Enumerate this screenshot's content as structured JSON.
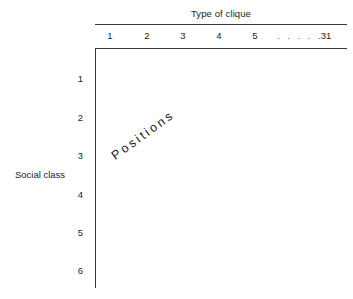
{
  "figure": {
    "columns": {
      "group_title": "Type of clique",
      "labels": [
        "1",
        "2",
        "3",
        "4",
        "5"
      ],
      "ellipsis": ". . . . .",
      "last_label": "31"
    },
    "rows": {
      "group_title": "Social class",
      "labels": [
        "1",
        "2",
        "3",
        "4",
        "5",
        "6"
      ]
    },
    "body": {
      "label": "Positions"
    }
  },
  "style": {
    "ink": "#1d1d1d",
    "rule": "#3a3a3a",
    "background": "#ffffff"
  }
}
